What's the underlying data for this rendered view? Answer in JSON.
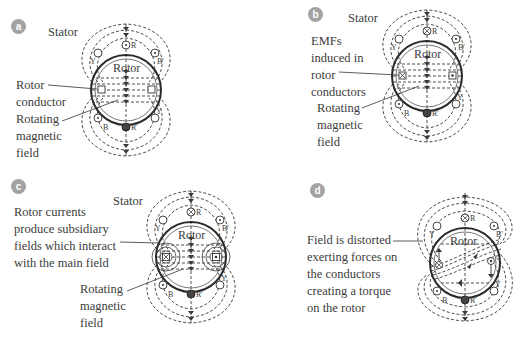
{
  "figure": {
    "panels": [
      {
        "id": "a",
        "badge": "a",
        "stator_label": "Stator",
        "rotor_label": "Rotor",
        "annotations": [
          {
            "lines": [
              "Rotor",
              "conductor"
            ]
          },
          {
            "lines": [
              "Rotating",
              "magnetic",
              "field"
            ]
          }
        ],
        "conductor_symbols": {
          "top": "R",
          "top_left": "Y",
          "top_right": "B'",
          "bottom": "R'",
          "bottom_left": "B",
          "bottom_right": "Y"
        },
        "rotor_conductors": [
          "empty",
          "empty"
        ]
      },
      {
        "id": "b",
        "badge": "b",
        "stator_label": "Stator",
        "rotor_label": "Rotor",
        "annotations": [
          {
            "lines": [
              "EMFs",
              "induced in",
              "rotor",
              "conductors"
            ]
          },
          {
            "lines": [
              "Rotating",
              "magnetic",
              "field"
            ]
          }
        ],
        "conductor_symbols": {
          "top": "R",
          "top_left": "Y",
          "top_right": "B'",
          "bottom": "R'",
          "bottom_left": "B",
          "bottom_right": "Y"
        },
        "rotor_conductors": [
          "cross",
          "dot"
        ]
      },
      {
        "id": "c",
        "badge": "c",
        "stator_label": "Stator",
        "rotor_label": "Rotor",
        "annotations": [
          {
            "lines": [
              "Rotor currents",
              "produce subsidiary",
              "fields which interact",
              "with the main field"
            ]
          },
          {
            "lines": [
              "Rotating",
              "magnetic",
              "field"
            ]
          }
        ],
        "conductor_symbols": {
          "top": "R",
          "top_left": "Y",
          "top_right": "B'",
          "bottom": "R'",
          "bottom_left": "B",
          "bottom_right": "Y"
        },
        "rotor_conductors": [
          "cross",
          "dot"
        ]
      },
      {
        "id": "d",
        "badge": "d",
        "rotor_label": "Rotor",
        "annotations": [
          {
            "lines": [
              "Field is distorted",
              "exerting forces on",
              "the conductors",
              "creating a torque",
              "on the rotor"
            ]
          }
        ],
        "conductor_symbols": {
          "top": "R",
          "top_left": "Y",
          "top_right": "B'",
          "bottom": "R'",
          "bottom_left": "B",
          "bottom_right": "Y"
        },
        "rotor_conductors": [
          "cross",
          "dot"
        ]
      }
    ],
    "colors": {
      "line": "#3a3a3a",
      "badge": "#a3a3a3",
      "text": "#3c3c3c"
    }
  }
}
